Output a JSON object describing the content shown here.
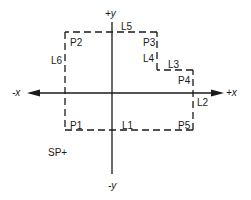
{
  "diagram": {
    "type": "coordinate-path-diagram",
    "axes": {
      "pos_x": "+x",
      "neg_x": "-x",
      "pos_y": "+y",
      "neg_y": "-y"
    },
    "points": {
      "p1": "P1",
      "p2": "P2",
      "p3": "P3",
      "p4": "P4",
      "p5": "P5"
    },
    "lines": {
      "l1": "L1",
      "l2": "L2",
      "l3": "L3",
      "l4": "L4",
      "l5": "L5",
      "l6": "L6"
    },
    "annotation": "SP+",
    "colors": {
      "stroke": "#1a1a1a",
      "background": "#ffffff"
    }
  }
}
